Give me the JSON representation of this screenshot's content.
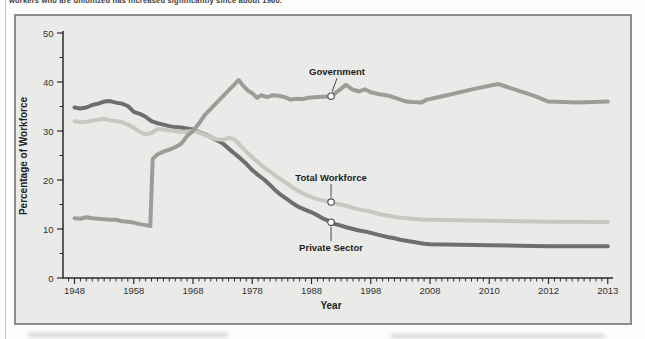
{
  "page": {
    "caption_fragment": "workers who are unionized has increased significantly since about 1960."
  },
  "chart_data": {
    "type": "line",
    "title": "",
    "xlabel": "Year",
    "ylabel": "Percentage of Workforce",
    "x_axis": {
      "tick_labels": [
        1948,
        1958,
        1968,
        1978,
        1988,
        1998,
        2008,
        2010,
        2012,
        2013
      ],
      "note": "labels evenly spaced on axis despite unequal year intervals",
      "minor_ticks_per_interval": 9
    },
    "y_axis": {
      "ticks": [
        0,
        10,
        20,
        30,
        40,
        50
      ],
      "minor_step": 5,
      "range": [
        0,
        50
      ]
    },
    "grid": false,
    "legend_position": "inline-annotations",
    "series": [
      {
        "name": "Government",
        "color": "#9c9c99",
        "points": [
          [
            1948,
            12.2
          ],
          [
            1949,
            12.1
          ],
          [
            1950,
            12.4
          ],
          [
            1951,
            12.2
          ],
          [
            1952,
            12.1
          ],
          [
            1953,
            12.0
          ],
          [
            1954,
            11.9
          ],
          [
            1955,
            11.9
          ],
          [
            1956,
            11.6
          ],
          [
            1957,
            11.5
          ],
          [
            1958,
            11.3
          ],
          [
            1959,
            11.0
          ],
          [
            1960,
            10.8
          ],
          [
            1960.8,
            10.6
          ],
          [
            1961.2,
            24.3
          ],
          [
            1962,
            25.2
          ],
          [
            1963,
            25.8
          ],
          [
            1964,
            26.2
          ],
          [
            1965,
            26.7
          ],
          [
            1966,
            27.4
          ],
          [
            1967,
            29.0
          ],
          [
            1968,
            30.0
          ],
          [
            1969,
            31.5
          ],
          [
            1970,
            33.3
          ],
          [
            1971,
            34.5
          ],
          [
            1972,
            35.8
          ],
          [
            1973,
            37.0
          ],
          [
            1974,
            38.3
          ],
          [
            1975,
            39.5
          ],
          [
            1975.7,
            40.4
          ],
          [
            1976.5,
            39.2
          ],
          [
            1977.3,
            38.2
          ],
          [
            1978,
            37.7
          ],
          [
            1978.8,
            36.8
          ],
          [
            1979.5,
            37.3
          ],
          [
            1980.5,
            36.9
          ],
          [
            1981.5,
            37.3
          ],
          [
            1982.5,
            37.2
          ],
          [
            1983.5,
            36.9
          ],
          [
            1984.5,
            36.4
          ],
          [
            1985.5,
            36.6
          ],
          [
            1986.5,
            36.5
          ],
          [
            1987.5,
            36.8
          ],
          [
            1988.5,
            36.9
          ],
          [
            1990,
            37.0
          ],
          [
            1991.3,
            37.1
          ],
          [
            1992.5,
            38.2
          ],
          [
            1993.8,
            39.4
          ],
          [
            1995,
            38.4
          ],
          [
            1996,
            38.1
          ],
          [
            1997,
            38.5
          ],
          [
            1998,
            37.9
          ],
          [
            1999.5,
            37.5
          ],
          [
            2001,
            37.2
          ],
          [
            2002.5,
            36.6
          ],
          [
            2004,
            36.0
          ],
          [
            2005,
            35.9
          ],
          [
            2006.5,
            35.8
          ],
          [
            2007.5,
            36.4
          ],
          [
            2008.5,
            37.2
          ],
          [
            2009.5,
            38.6
          ],
          [
            2010.3,
            39.6
          ],
          [
            2011,
            38.2
          ],
          [
            2011.5,
            37.2
          ],
          [
            2012,
            36.0
          ],
          [
            2012.5,
            35.8
          ],
          [
            2013,
            36.0
          ]
        ]
      },
      {
        "name": "Total Workforce",
        "color": "#c7c9c1",
        "points": [
          [
            1948,
            32.0
          ],
          [
            1949,
            31.8
          ],
          [
            1950,
            31.9
          ],
          [
            1951,
            32.1
          ],
          [
            1952,
            32.3
          ],
          [
            1953,
            32.5
          ],
          [
            1954,
            32.2
          ],
          [
            1955,
            32.0
          ],
          [
            1956,
            31.8
          ],
          [
            1957,
            31.3
          ],
          [
            1958,
            30.7
          ],
          [
            1959,
            29.8
          ],
          [
            1960,
            29.3
          ],
          [
            1961,
            29.6
          ],
          [
            1962,
            30.4
          ],
          [
            1963,
            30.3
          ],
          [
            1964,
            30.1
          ],
          [
            1965,
            30.0
          ],
          [
            1966,
            29.8
          ],
          [
            1967,
            29.9
          ],
          [
            1968,
            30.0
          ],
          [
            1969,
            29.7
          ],
          [
            1970,
            29.2
          ],
          [
            1971,
            28.8
          ],
          [
            1972,
            28.3
          ],
          [
            1973,
            28.2
          ],
          [
            1974,
            28.6
          ],
          [
            1975,
            28.3
          ],
          [
            1976,
            27.0
          ],
          [
            1977,
            25.8
          ],
          [
            1978,
            24.6
          ],
          [
            1979,
            23.6
          ],
          [
            1980,
            22.6
          ],
          [
            1981,
            21.7
          ],
          [
            1982,
            20.8
          ],
          [
            1983,
            20.0
          ],
          [
            1984,
            19.2
          ],
          [
            1985,
            18.3
          ],
          [
            1986,
            17.6
          ],
          [
            1987,
            17.0
          ],
          [
            1988,
            16.5
          ],
          [
            1989,
            16.1
          ],
          [
            1990,
            15.8
          ],
          [
            1991.3,
            15.5
          ],
          [
            1992,
            15.2
          ],
          [
            1993,
            15.0
          ],
          [
            1994,
            14.7
          ],
          [
            1995,
            14.3
          ],
          [
            1996,
            14.0
          ],
          [
            1997,
            13.8
          ],
          [
            1998,
            13.5
          ],
          [
            1999,
            13.2
          ],
          [
            2000,
            12.9
          ],
          [
            2001,
            12.7
          ],
          [
            2002,
            12.5
          ],
          [
            2003,
            12.3
          ],
          [
            2004,
            12.2
          ],
          [
            2005,
            12.1
          ],
          [
            2006,
            12.0
          ],
          [
            2007,
            11.9
          ],
          [
            2008,
            11.9
          ],
          [
            2009,
            11.8
          ],
          [
            2010,
            11.7
          ],
          [
            2011,
            11.6
          ],
          [
            2012,
            11.5
          ],
          [
            2013,
            11.4
          ]
        ]
      },
      {
        "name": "Private Sector",
        "color": "#6e6e6e",
        "points": [
          [
            1948,
            34.8
          ],
          [
            1949,
            34.6
          ],
          [
            1950,
            34.8
          ],
          [
            1951,
            35.3
          ],
          [
            1952,
            35.6
          ],
          [
            1953,
            36.0
          ],
          [
            1954,
            36.1
          ],
          [
            1955,
            35.8
          ],
          [
            1956,
            35.6
          ],
          [
            1957,
            35.1
          ],
          [
            1958,
            33.9
          ],
          [
            1959,
            33.5
          ],
          [
            1960,
            32.9
          ],
          [
            1961,
            32.0
          ],
          [
            1962,
            31.6
          ],
          [
            1963,
            31.3
          ],
          [
            1964,
            31.0
          ],
          [
            1965,
            30.8
          ],
          [
            1966,
            30.7
          ],
          [
            1967,
            30.5
          ],
          [
            1968,
            30.3
          ],
          [
            1969,
            29.8
          ],
          [
            1970,
            29.3
          ],
          [
            1971,
            28.8
          ],
          [
            1972,
            28.1
          ],
          [
            1973,
            27.5
          ],
          [
            1974,
            26.4
          ],
          [
            1975,
            25.4
          ],
          [
            1976,
            24.4
          ],
          [
            1977,
            23.3
          ],
          [
            1978,
            22.0
          ],
          [
            1979,
            21.0
          ],
          [
            1980,
            20.1
          ],
          [
            1981,
            19.0
          ],
          [
            1982,
            17.8
          ],
          [
            1983,
            16.8
          ],
          [
            1984,
            16.0
          ],
          [
            1985,
            15.1
          ],
          [
            1986,
            14.4
          ],
          [
            1987,
            13.9
          ],
          [
            1988,
            13.4
          ],
          [
            1989,
            12.8
          ],
          [
            1990,
            12.1
          ],
          [
            1991.3,
            11.4
          ],
          [
            1992,
            11.0
          ],
          [
            1993,
            10.7
          ],
          [
            1994,
            10.3
          ],
          [
            1995,
            10.0
          ],
          [
            1996,
            9.7
          ],
          [
            1997,
            9.5
          ],
          [
            1998,
            9.2
          ],
          [
            1999,
            8.9
          ],
          [
            2000,
            8.6
          ],
          [
            2001,
            8.3
          ],
          [
            2002,
            8.1
          ],
          [
            2003,
            7.8
          ],
          [
            2004,
            7.6
          ],
          [
            2005,
            7.4
          ],
          [
            2006,
            7.2
          ],
          [
            2007,
            7.0
          ],
          [
            2008,
            6.9
          ],
          [
            2009,
            6.8
          ],
          [
            2010,
            6.7
          ],
          [
            2011,
            6.6
          ],
          [
            2012,
            6.5
          ],
          [
            2013,
            6.5
          ]
        ]
      }
    ],
    "annotations": [
      {
        "label": "Government",
        "year": 1991.3,
        "value": 37.1,
        "side": "above",
        "dx": 6
      },
      {
        "label": "Total Workforce",
        "year": 1991.3,
        "value": 15.5,
        "side": "above",
        "dx": 0
      },
      {
        "label": "Private Sector",
        "year": 1991.3,
        "value": 11.4,
        "side": "below",
        "dx": 0
      }
    ],
    "colors": {
      "panel_bg": "#eaeae8",
      "panel_border": "#8c8c8c",
      "axis": "#2b2b2b"
    }
  }
}
